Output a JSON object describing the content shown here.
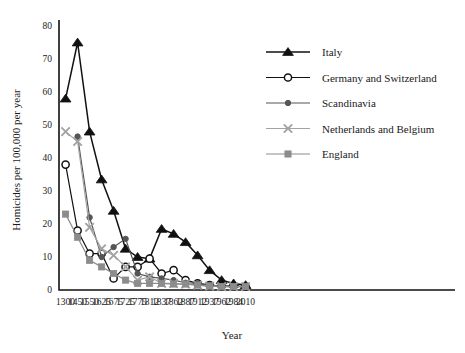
{
  "chart_data": {
    "type": "line",
    "title": "",
    "xlabel": "Year",
    "ylabel": "Homicides per 100,000 per year",
    "categories": [
      "1300",
      "1450",
      "1550",
      "1625",
      "1675",
      "1725",
      "1775",
      "1812",
      "1837",
      "1862",
      "1887",
      "1912",
      "1937",
      "1962",
      "1984",
      "2010"
    ],
    "ylim": [
      0,
      80
    ],
    "yticks": [
      0,
      10,
      20,
      30,
      40,
      50,
      60,
      70,
      80
    ],
    "grid": false,
    "legend_position": "right-top",
    "series": [
      {
        "name": "Italy",
        "marker": "filled-triangle",
        "color": "#111111",
        "values": [
          58,
          75,
          48,
          33.5,
          24,
          12.5,
          10,
          9.5,
          18.5,
          17,
          14.5,
          10.5,
          6,
          3,
          2,
          1.5
        ]
      },
      {
        "name": "Germany and Switzerland",
        "marker": "open-circle",
        "color": "#111111",
        "values": [
          38,
          18,
          11,
          11,
          3.5,
          7,
          7,
          9.5,
          5,
          6,
          3,
          2,
          1.5,
          1.2,
          1.2,
          1
        ]
      },
      {
        "name": "Scandinavia",
        "marker": "filled-circle",
        "color": "#555555",
        "values": [
          null,
          46.5,
          22,
          10,
          13,
          15.5,
          5,
          4,
          3.5,
          3,
          2.2,
          2,
          1.5,
          1.2,
          1.2,
          1
        ]
      },
      {
        "name": "Netherlands and Belgium",
        "marker": "cross-x",
        "color": "#a3a3a3",
        "values": [
          48,
          45,
          19,
          12.5,
          10.5,
          7,
          3,
          4,
          2,
          2,
          1.8,
          1.5,
          1.2,
          1,
          1,
          1
        ]
      },
      {
        "name": "England",
        "marker": "filled-square",
        "color": "#8c8c8c",
        "values": [
          23,
          16,
          9,
          7,
          5,
          3,
          2,
          2,
          2,
          1.8,
          1.8,
          1.5,
          1.2,
          1,
          1,
          1
        ]
      }
    ]
  },
  "legend": {
    "items": [
      {
        "label": "Italy"
      },
      {
        "label": "Germany and Switzerland"
      },
      {
        "label": "Scandinavia"
      },
      {
        "label": "Netherlands and Belgium"
      },
      {
        "label": "England"
      }
    ]
  }
}
